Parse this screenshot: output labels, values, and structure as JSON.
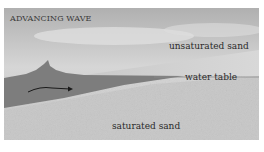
{
  "figure": {
    "title": "ADVANCING WAVE",
    "labels": {
      "unsaturated_sand": "unsaturated sand",
      "water_table": "water table",
      "saturated_sand": "saturated sand"
    },
    "colors": {
      "sky_top": "#b3b3b3",
      "sky_light": "#dcdcdc",
      "unsaturated_sand": "#d4d4d4",
      "water": "#7d7d7d",
      "saturated_sand": "#c8c8c8",
      "water_table_line": "#8a8a8a",
      "arrow": "#1a1a1a"
    }
  }
}
